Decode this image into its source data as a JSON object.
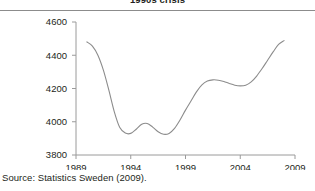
{
  "figure": {
    "title": "1990s crisis",
    "source": "Source: Statistics Sweden (2009)."
  },
  "chart_data": {
    "type": "line",
    "title": "1990s crisis",
    "xlabel": "",
    "ylabel": "",
    "xlim": [
      1989,
      2009
    ],
    "ylim": [
      3800,
      4600
    ],
    "xticks": [
      "1989",
      "1994",
      "1999",
      "2004",
      "2009"
    ],
    "yticks": [
      "3800",
      "4000",
      "4200",
      "4400",
      "4600"
    ],
    "grid": false,
    "legend": "none",
    "line_color": "#8c8c8c",
    "series": [
      {
        "name": "Employment (thousands)",
        "x": [
          1990.0,
          1990.5,
          1991.0,
          1991.5,
          1992.0,
          1992.5,
          1993.0,
          1993.5,
          1994.0,
          1994.5,
          1995.0,
          1995.5,
          1996.0,
          1996.5,
          1997.0,
          1997.5,
          1998.0,
          1998.5,
          1999.0,
          1999.5,
          2000.0,
          2000.5,
          2001.0,
          2001.5,
          2002.0,
          2002.5,
          2003.0,
          2003.5,
          2004.0,
          2004.5,
          2005.0,
          2005.5,
          2006.0,
          2006.5,
          2007.0,
          2007.5,
          2008.0
        ],
        "values": [
          4480,
          4455,
          4400,
          4310,
          4190,
          4060,
          3965,
          3932,
          3930,
          3955,
          3985,
          3990,
          3968,
          3940,
          3925,
          3930,
          3960,
          4010,
          4070,
          4125,
          4180,
          4222,
          4245,
          4252,
          4250,
          4242,
          4230,
          4220,
          4216,
          4220,
          4240,
          4275,
          4320,
          4370,
          4420,
          4465,
          4488
        ]
      }
    ]
  }
}
